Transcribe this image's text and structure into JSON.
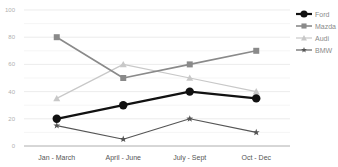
{
  "chart_data": {
    "type": "line",
    "title": "",
    "xlabel": "",
    "ylabel": "",
    "ylim": [
      0,
      100
    ],
    "yticks": [
      0,
      20,
      40,
      60,
      80,
      100
    ],
    "grid": true,
    "legend_position": "right",
    "categories": [
      "Jan - March",
      "April - June",
      "July - Sept",
      "Oct - Dec"
    ],
    "series": [
      {
        "name": "Ford",
        "values": [
          20,
          30,
          40,
          35
        ],
        "color": "#111111",
        "marker": "circle",
        "width": 2.2
      },
      {
        "name": "Mazda",
        "values": [
          80,
          50,
          60,
          70
        ],
        "color": "#8a8a8a",
        "marker": "square",
        "width": 1.6
      },
      {
        "name": "Audi",
        "values": [
          35,
          60,
          50,
          40
        ],
        "color": "#c8c8c8",
        "marker": "triangle",
        "width": 1.2
      },
      {
        "name": "BMW",
        "values": [
          15,
          5,
          20,
          10
        ],
        "color": "#555555",
        "marker": "star",
        "width": 1.1
      }
    ]
  }
}
